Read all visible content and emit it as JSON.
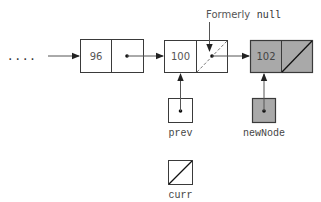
{
  "diagram": {
    "ellipsis": "....",
    "nodes": [
      {
        "id": "node-96",
        "value": "96",
        "next": "pointer",
        "shaded": false
      },
      {
        "id": "node-100",
        "value": "100",
        "next": "pointer (formerly null)",
        "shaded": false
      },
      {
        "id": "node-102",
        "value": "102",
        "next": "null",
        "shaded": true
      }
    ],
    "annotation": {
      "prefix": "Formerly",
      "code": "null"
    },
    "references": [
      {
        "name": "prev",
        "points_to": "node-100",
        "shaded": false
      },
      {
        "name": "newNode",
        "points_to": "node-102",
        "shaded": true
      },
      {
        "name": "curr",
        "points_to": "null",
        "shaded": false
      }
    ],
    "colors": {
      "stroke": "#3a3a3a",
      "shaded_fill": "#a9a9a9",
      "text": "#555555",
      "arrow": "#222222"
    }
  }
}
